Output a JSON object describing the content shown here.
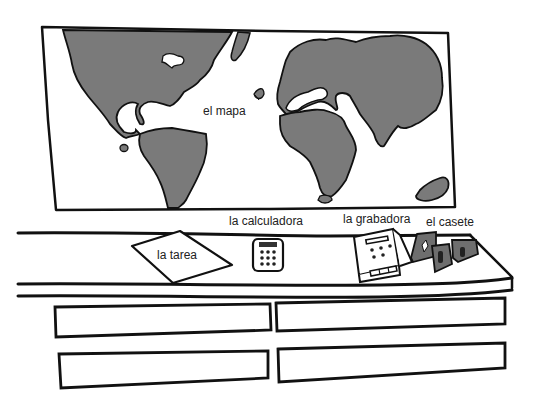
{
  "scene": {
    "description": "Classroom vocabulary illustration: world map on wall above a desk with homework, calculator, tape recorder and cassettes",
    "colors": {
      "ink": "#111111",
      "land": "#7a7a7a",
      "cassette": "#6e6e6e",
      "background": "#ffffff"
    }
  },
  "labels": {
    "map": "el mapa",
    "homework": "la tarea",
    "calculator": "la calculadora",
    "recorder": "la grabadora",
    "cassette": "el casete"
  },
  "answer_boxes": [
    {
      "position": "top-left",
      "value": ""
    },
    {
      "position": "top-right",
      "value": ""
    },
    {
      "position": "bottom-left",
      "value": ""
    },
    {
      "position": "bottom-right",
      "value": ""
    }
  ]
}
